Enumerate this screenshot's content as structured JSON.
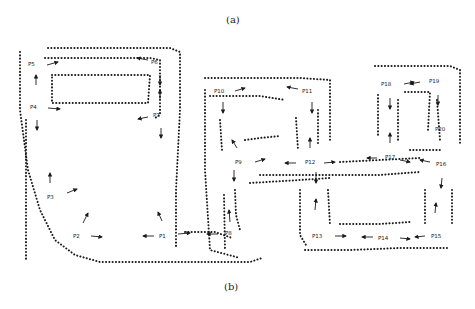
{
  "captions": {
    "top": "(a)",
    "bottom": "(b)"
  },
  "points": [
    {
      "id": "P1",
      "x": 164,
      "y": 236
    },
    {
      "id": "P2",
      "x": 78,
      "y": 236
    },
    {
      "id": "P3",
      "x": 52,
      "y": 197
    },
    {
      "id": "P4",
      "x": 35,
      "y": 107
    },
    {
      "id": "P5",
      "x": 33,
      "y": 64
    },
    {
      "id": "P6",
      "x": 156,
      "y": 62
    },
    {
      "id": "P7",
      "x": 158,
      "y": 115
    },
    {
      "id": "P8",
      "x": 230,
      "y": 233
    },
    {
      "id": "P9",
      "x": 240,
      "y": 162
    },
    {
      "id": "P10",
      "x": 219,
      "y": 91
    },
    {
      "id": "P11",
      "x": 307,
      "y": 91
    },
    {
      "id": "P12",
      "x": 310,
      "y": 162
    },
    {
      "id": "P13",
      "x": 317,
      "y": 236
    },
    {
      "id": "P14",
      "x": 383,
      "y": 238
    },
    {
      "id": "P15",
      "x": 436,
      "y": 236
    },
    {
      "id": "P16",
      "x": 441,
      "y": 164
    },
    {
      "id": "P17",
      "x": 390,
      "y": 157
    },
    {
      "id": "P18",
      "x": 386,
      "y": 84
    },
    {
      "id": "P19",
      "x": 434,
      "y": 81
    },
    {
      "id": "P20",
      "x": 440,
      "y": 129
    }
  ],
  "colors": {
    "ink": "#1a1a1a",
    "background": "#ffffff"
  }
}
